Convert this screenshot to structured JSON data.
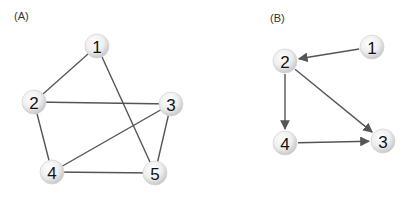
{
  "panels": [
    {
      "label": "(A)",
      "label_pos": [
        14,
        20
      ],
      "directed": false,
      "nodes": [
        {
          "id": "1",
          "x": 97,
          "y": 46
        },
        {
          "id": "2",
          "x": 34,
          "y": 102
        },
        {
          "id": "3",
          "x": 171,
          "y": 104
        },
        {
          "id": "4",
          "x": 52,
          "y": 172
        },
        {
          "id": "5",
          "x": 155,
          "y": 173
        }
      ],
      "edges": [
        [
          "1",
          "2"
        ],
        [
          "1",
          "5"
        ],
        [
          "2",
          "3"
        ],
        [
          "2",
          "4"
        ],
        [
          "3",
          "4"
        ],
        [
          "3",
          "5"
        ],
        [
          "4",
          "5"
        ]
      ]
    },
    {
      "label": "(B)",
      "label_pos": [
        270,
        22
      ],
      "directed": true,
      "nodes": [
        {
          "id": "1",
          "x": 372,
          "y": 47
        },
        {
          "id": "2",
          "x": 285,
          "y": 61
        },
        {
          "id": "3",
          "x": 383,
          "y": 141
        },
        {
          "id": "4",
          "x": 285,
          "y": 143
        }
      ],
      "edges": [
        [
          "1",
          "2"
        ],
        [
          "2",
          "4"
        ],
        [
          "2",
          "3"
        ],
        [
          "4",
          "3"
        ]
      ]
    }
  ],
  "style": {
    "edge_color": "#555555",
    "node_fill_light": "#ffffff",
    "node_fill_dark": "#cfcfcf",
    "node_radius": 12
  }
}
